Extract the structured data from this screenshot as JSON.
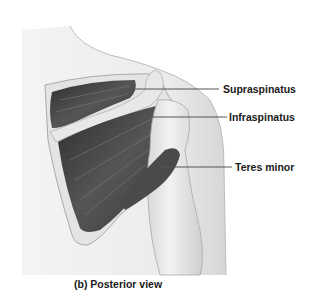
{
  "figure": {
    "caption": "(b) Posterior view",
    "labels": [
      {
        "text": "Supraspinatus",
        "line_y": 89
      },
      {
        "text": "Infraspinatus",
        "line_y": 117
      },
      {
        "text": "Teres minor",
        "line_y": 167
      }
    ]
  },
  "colors": {
    "background": "#ffffff",
    "skin": "#eeeeee",
    "skin_shadow": "#d2d2d2",
    "muscle_dark": "#3a3a3a",
    "muscle_mid": "#6a6a6a",
    "bone": "#e2e2e2",
    "leader_line": "#555555",
    "text": "#1a1a1a"
  }
}
